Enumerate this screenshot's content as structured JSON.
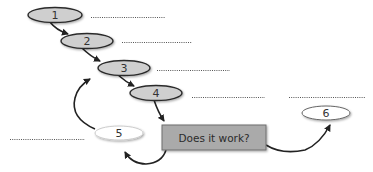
{
  "diagram": {
    "type": "process-flow",
    "colors": {
      "step_fill": "#cfcfcf",
      "step_stroke": "#2b2b2b",
      "loop_node_fill": "#ffffff",
      "decision_fill": "#aaaaaa",
      "decision_stroke": "#6e6e6e",
      "arrow": "#222222",
      "dotted_line": "#555555"
    },
    "nodes": [
      {
        "id": "1",
        "label": "1",
        "shape": "ellipse",
        "style": "gray"
      },
      {
        "id": "2",
        "label": "2",
        "shape": "ellipse",
        "style": "gray"
      },
      {
        "id": "3",
        "label": "3",
        "shape": "ellipse",
        "style": "gray"
      },
      {
        "id": "4",
        "label": "4",
        "shape": "ellipse",
        "style": "gray"
      },
      {
        "id": "5",
        "label": "5",
        "shape": "ellipse",
        "style": "white"
      },
      {
        "id": "6",
        "label": "6",
        "shape": "ellipse",
        "style": "white"
      }
    ],
    "decision": {
      "label": "Does it work?",
      "shape": "rectangle"
    },
    "edges": [
      {
        "from": "1",
        "to": "2"
      },
      {
        "from": "2",
        "to": "3"
      },
      {
        "from": "3",
        "to": "4"
      },
      {
        "from": "4",
        "to": "decision"
      },
      {
        "from": "decision",
        "to": "5"
      },
      {
        "from": "5",
        "to": "3"
      },
      {
        "from": "decision",
        "to": "6"
      }
    ],
    "blank_lines": [
      {
        "near": "1"
      },
      {
        "near": "2"
      },
      {
        "near": "3"
      },
      {
        "near": "4"
      },
      {
        "near": "6"
      },
      {
        "near": "5"
      }
    ]
  }
}
